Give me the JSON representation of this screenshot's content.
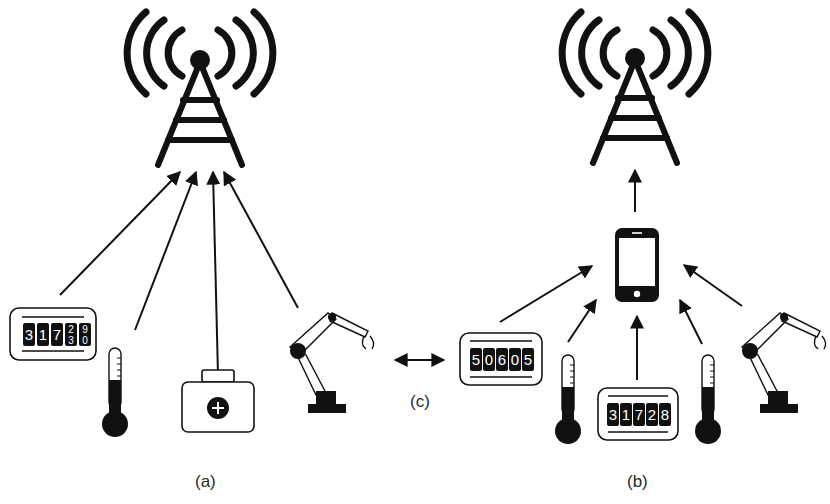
{
  "diagram": {
    "panels": [
      {
        "id": "a",
        "caption": "(a)",
        "description": "Devices connect directly to cell tower",
        "devices": [
          "meter",
          "thermometer",
          "medical-kit",
          "robot-arm"
        ]
      },
      {
        "id": "b",
        "caption": "(b)",
        "description": "Devices connect via smartphone gateway to cell tower",
        "devices": [
          "meter",
          "thermometer",
          "meter",
          "thermometer",
          "robot-arm"
        ]
      }
    ],
    "connector": {
      "caption": "(c)",
      "type": "bidirectional-arrow"
    },
    "meters": {
      "left_meter": {
        "digits": [
          "3",
          "1",
          "7"
        ],
        "rolling_top": [
          "2",
          "9"
        ],
        "rolling_bottom": [
          "3",
          "0"
        ]
      },
      "right_meter_1": {
        "digits": [
          "5",
          "0",
          "6",
          "0",
          "5"
        ]
      },
      "right_meter_2": {
        "digits": [
          "3",
          "1",
          "7",
          "2",
          "8"
        ]
      }
    },
    "colors": {
      "stroke": "#111111",
      "background": "#ffffff",
      "caption": "#2a2a2a"
    }
  }
}
